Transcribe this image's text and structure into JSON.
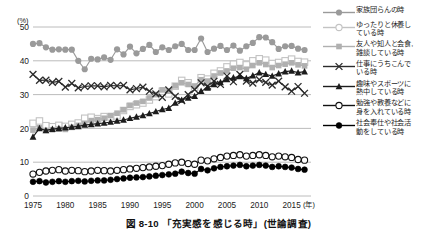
{
  "figure": {
    "caption": "図 8-10 「充実感を感じる時」(世論調査)",
    "y_unit": "(%)",
    "x_unit": "(年)"
  },
  "chart_data": {
    "type": "line",
    "title": "図 8-10 「充実感を感じる時」(世論調査)",
    "xlabel": "(年)",
    "ylabel": "(%)",
    "xlim": [
      1975,
      2018
    ],
    "ylim": [
      0,
      50
    ],
    "yticks": [
      0,
      10,
      20,
      30,
      40,
      50
    ],
    "xticks": [
      1975,
      1980,
      1985,
      1990,
      1995,
      2000,
      2005,
      2010,
      2015
    ],
    "grid": "horizontal",
    "legend_position": "right",
    "series": [
      {
        "name": "家族団らんの時",
        "marker": "filled-circle",
        "color": "#9a9a9a",
        "x": [
          1975,
          1976,
          1977,
          1978,
          1979,
          1980,
          1981,
          1982,
          1983,
          1984,
          1985,
          1986,
          1987,
          1988,
          1989,
          1990,
          1991,
          1992,
          1993,
          1994,
          1995,
          1996,
          1997,
          1998,
          1999,
          2000,
          2001,
          2002,
          2003,
          2004,
          2005,
          2006,
          2007,
          2008,
          2009,
          2010,
          2011,
          2012,
          2013,
          2014,
          2015,
          2016,
          2017
        ],
        "values": [
          45.0,
          45.2,
          44.0,
          43.3,
          43.4,
          43.3,
          43.3,
          40.0,
          37.5,
          40.6,
          40.4,
          41.0,
          40.3,
          43.4,
          41.9,
          44.2,
          42.2,
          43.5,
          44.7,
          42.6,
          44.0,
          43.2,
          44.3,
          45.0,
          43.2,
          43.2,
          46.6,
          42.6,
          43.6,
          44.4,
          43.2,
          44.5,
          43.0,
          44.3,
          45.3,
          47.0,
          46.9,
          45.5,
          43.5,
          44.3,
          44.4,
          43.6,
          43.2
        ]
      },
      {
        "name": "ゆったりと休養し\nている時",
        "marker": "open-square",
        "color": "#c3c3c3",
        "x": [
          1975,
          1976,
          1977,
          1978,
          1979,
          1980,
          1981,
          1982,
          1983,
          1984,
          1985,
          1986,
          1987,
          1988,
          1989,
          1990,
          1991,
          1992,
          1993,
          1994,
          1995,
          1996,
          1997,
          1998,
          1999,
          2000,
          2001,
          2002,
          2003,
          2004,
          2005,
          2006,
          2007,
          2008,
          2009,
          2010,
          2011,
          2012,
          2013,
          2014,
          2015,
          2016,
          2017
        ],
        "values": [
          21.5,
          22.2,
          20.8,
          20.5,
          20.9,
          20.6,
          21.2,
          21.6,
          23.0,
          23.3,
          22.9,
          23.5,
          23.4,
          23.7,
          25.3,
          26.5,
          27.0,
          27.5,
          28.4,
          29.4,
          31.0,
          30.2,
          32.5,
          34.2,
          33.5,
          32.2,
          35.0,
          34.6,
          36.3,
          37.0,
          38.2,
          39.0,
          39.5,
          38.8,
          40.0,
          40.6,
          40.2,
          39.2,
          39.5,
          40.0,
          40.5,
          39.8,
          39.6
        ]
      },
      {
        "name": "友人や知人と会食,\n雑談している時",
        "marker": "filled-square",
        "color": "#b0b0b0",
        "x": [
          1975,
          1976,
          1977,
          1978,
          1979,
          1980,
          1981,
          1982,
          1983,
          1984,
          1985,
          1986,
          1987,
          1988,
          1989,
          1990,
          1991,
          1992,
          1993,
          1994,
          1995,
          1996,
          1997,
          1998,
          1999,
          2000,
          2001,
          2002,
          2003,
          2004,
          2005,
          2006,
          2007,
          2008,
          2009,
          2010,
          2011,
          2012,
          2013,
          2014,
          2015,
          2016,
          2017
        ],
        "values": [
          19.5,
          20.2,
          19.4,
          19.6,
          19.8,
          19.7,
          20.3,
          20.9,
          21.5,
          22.3,
          22.6,
          23.0,
          23.8,
          24.5,
          25.5,
          26.8,
          27.5,
          28.0,
          29.0,
          30.0,
          31.4,
          31.0,
          32.6,
          33.5,
          33.0,
          32.5,
          34.4,
          34.0,
          35.5,
          36.4,
          37.0,
          37.8,
          38.0,
          37.5,
          38.6,
          39.4,
          38.9,
          38.0,
          38.6,
          39.0,
          39.4,
          38.8,
          38.5
        ]
      },
      {
        "name": "仕事にうちこんで\nいる時",
        "marker": "x-cross",
        "color": "#2b2b2b",
        "x": [
          1975,
          1976,
          1977,
          1978,
          1979,
          1980,
          1981,
          1982,
          1983,
          1984,
          1985,
          1986,
          1987,
          1988,
          1989,
          1990,
          1991,
          1992,
          1993,
          1994,
          1995,
          1996,
          1997,
          1998,
          1999,
          2000,
          2001,
          2002,
          2003,
          2004,
          2005,
          2006,
          2007,
          2008,
          2009,
          2010,
          2011,
          2012,
          2013,
          2014,
          2015,
          2016,
          2017
        ],
        "values": [
          36.0,
          34.2,
          34.3,
          33.6,
          33.9,
          32.2,
          33.3,
          32.0,
          32.4,
          32.6,
          32.6,
          32.3,
          32.7,
          32.6,
          32.7,
          31.4,
          31.8,
          32.2,
          31.0,
          30.2,
          29.2,
          31.4,
          29.5,
          28.2,
          30.0,
          31.5,
          33.5,
          32.5,
          34.0,
          33.0,
          35.5,
          33.8,
          36.0,
          34.0,
          33.4,
          34.4,
          33.6,
          32.8,
          34.0,
          32.3,
          31.0,
          32.4,
          30.4
        ]
      },
      {
        "name": "趣味やスポーツに\n熱中している時",
        "marker": "filled-triangle",
        "color": "#1c1c1c",
        "x": [
          1975,
          1976,
          1977,
          1978,
          1979,
          1980,
          1981,
          1982,
          1983,
          1984,
          1985,
          1986,
          1987,
          1988,
          1989,
          1990,
          1991,
          1992,
          1993,
          1994,
          1995,
          1996,
          1997,
          1998,
          1999,
          2000,
          2001,
          2002,
          2003,
          2004,
          2005,
          2006,
          2007,
          2008,
          2009,
          2010,
          2011,
          2012,
          2013,
          2014,
          2015,
          2016,
          2017
        ],
        "values": [
          17.5,
          20.0,
          19.4,
          19.8,
          20.0,
          20.2,
          20.4,
          20.6,
          21.0,
          21.2,
          21.4,
          21.6,
          21.9,
          22.2,
          22.5,
          23.0,
          23.4,
          23.8,
          24.4,
          25.0,
          25.6,
          26.0,
          27.5,
          28.4,
          29.0,
          29.5,
          31.0,
          32.0,
          33.0,
          33.6,
          34.5,
          35.0,
          35.4,
          34.8,
          35.6,
          36.5,
          36.0,
          35.5,
          36.2,
          36.8,
          37.0,
          36.5,
          36.8
        ]
      },
      {
        "name": "勉強や教養などに\n身を入れている時",
        "marker": "open-circle",
        "color": "#111111",
        "x": [
          1975,
          1976,
          1977,
          1978,
          1979,
          1980,
          1981,
          1982,
          1983,
          1984,
          1985,
          1986,
          1987,
          1988,
          1989,
          1990,
          1991,
          1992,
          1993,
          1994,
          1995,
          1996,
          1997,
          1998,
          1999,
          2000,
          2001,
          2002,
          2003,
          2004,
          2005,
          2006,
          2007,
          2008,
          2009,
          2010,
          2011,
          2012,
          2013,
          2014,
          2015,
          2016,
          2017
        ],
        "values": [
          6.5,
          7.0,
          7.4,
          7.6,
          7.8,
          7.4,
          7.6,
          7.5,
          7.2,
          7.4,
          7.6,
          7.5,
          7.4,
          7.6,
          7.8,
          8.0,
          8.2,
          8.4,
          8.6,
          8.8,
          9.0,
          9.4,
          9.8,
          10.0,
          9.6,
          9.4,
          10.6,
          10.4,
          11.0,
          11.4,
          11.8,
          12.0,
          12.2,
          11.8,
          12.0,
          12.2,
          12.0,
          11.6,
          11.8,
          11.6,
          11.4,
          10.8,
          10.6
        ]
      },
      {
        "name": "社会奉仕や社会活\n動をしている時",
        "marker": "filled-circle-small",
        "color": "#000000",
        "x": [
          1975,
          1976,
          1977,
          1978,
          1979,
          1980,
          1981,
          1982,
          1983,
          1984,
          1985,
          1986,
          1987,
          1988,
          1989,
          1990,
          1991,
          1992,
          1993,
          1994,
          1995,
          1996,
          1997,
          1998,
          1999,
          2000,
          2001,
          2002,
          2003,
          2004,
          2005,
          2006,
          2007,
          2008,
          2009,
          2010,
          2011,
          2012,
          2013,
          2014,
          2015,
          2016,
          2017
        ],
        "values": [
          4.2,
          4.4,
          4.0,
          4.2,
          4.4,
          4.2,
          4.4,
          4.5,
          4.3,
          4.5,
          4.6,
          4.6,
          4.8,
          5.0,
          5.2,
          5.4,
          5.5,
          5.6,
          5.8,
          6.0,
          6.2,
          6.4,
          6.6,
          7.2,
          6.8,
          6.6,
          8.0,
          7.6,
          8.2,
          8.6,
          8.8,
          9.0,
          9.2,
          8.8,
          9.0,
          9.2,
          9.0,
          8.6,
          8.8,
          8.6,
          8.4,
          8.0,
          7.8
        ]
      }
    ]
  },
  "legend": {
    "items": [
      {
        "label": "家族団らんの時",
        "marker": "filled-circle",
        "color": "#9a9a9a"
      },
      {
        "label": "ゆったりと休養し\nている時",
        "marker": "open-circle",
        "color": "#c3c3c3"
      },
      {
        "label": "友人や知人と会食,\n雑談している時",
        "marker": "filled-square",
        "color": "#b0b0b0"
      },
      {
        "label": "仕事にうちこんで\nいる時",
        "marker": "x-cross",
        "color": "#2b2b2b"
      },
      {
        "label": "趣味やスポーツに\n熱中している時",
        "marker": "filled-triangle",
        "color": "#1c1c1c"
      },
      {
        "label": "勉強や教養などに\n身を入れている時",
        "marker": "open-circle-lg",
        "color": "#111111"
      },
      {
        "label": "社会奉仕や社会活\n動をしている時",
        "marker": "filled-circle-small",
        "color": "#000000"
      }
    ]
  }
}
